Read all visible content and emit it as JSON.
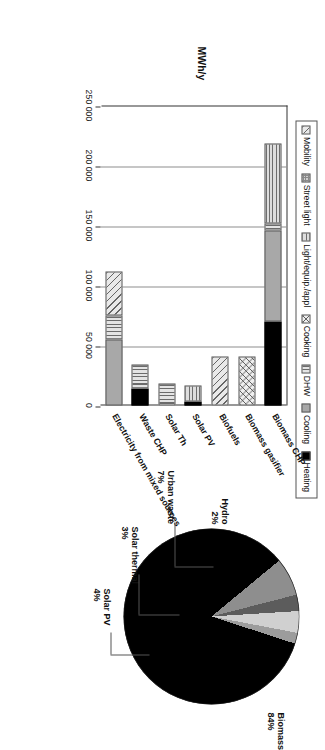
{
  "figure": {
    "orientation_deg": 90,
    "axis_title": "MWh/y"
  },
  "legend": {
    "items": [
      {
        "label": "Mobility",
        "pattern": "diagonal-hatch"
      },
      {
        "label": "Street light",
        "pattern": "checker"
      },
      {
        "label": "Light/equip./appl",
        "pattern": "horizontal-lines"
      },
      {
        "label": "Cooking",
        "pattern": "cross-hatch"
      },
      {
        "label": "DHW",
        "pattern": "vertical-lines"
      },
      {
        "label": "Cooling",
        "pattern": "solid-gray"
      },
      {
        "label": "Heating",
        "pattern": "solid-black"
      }
    ]
  },
  "chart_data": [
    {
      "type": "bar",
      "id": "energy-supply-by-enduse",
      "orientation": "horizontal",
      "stacked": true,
      "title": "",
      "xlabel": "",
      "ylabel": "MWh/y",
      "ylim": [
        0,
        250000
      ],
      "ticks": [
        "250 000",
        "200 000",
        "150 000",
        "100 000",
        "50 000",
        "0"
      ],
      "tick_values": [
        250000,
        200000,
        150000,
        100000,
        50000,
        0
      ],
      "grid": true,
      "legend_position": "top",
      "categories": [
        "Biomass CHP",
        "Biomass gasifier",
        "Biofuels",
        "Solar PV",
        "Solar Th",
        "Waste CHP",
        "Electricity from mixed sources"
      ],
      "series": [
        {
          "name": "Mobility",
          "values": [
            0,
            0,
            41000,
            0,
            0,
            0,
            37000
          ]
        },
        {
          "name": "Street light",
          "values": [
            0,
            0,
            0,
            0,
            0,
            0,
            0
          ]
        },
        {
          "name": "Light/equip./appl",
          "values": [
            66000,
            0,
            0,
            14000,
            0,
            0,
            0
          ]
        },
        {
          "name": "Cooking",
          "values": [
            0,
            41000,
            0,
            0,
            0,
            0,
            0
          ]
        },
        {
          "name": "DHW",
          "values": [
            6000,
            0,
            0,
            0,
            18000,
            20000,
            20000
          ]
        },
        {
          "name": "Cooling",
          "values": [
            76000,
            0,
            0,
            0,
            0,
            0,
            55000
          ]
        },
        {
          "name": "Heating",
          "values": [
            70000,
            0,
            0,
            3000,
            0,
            14000,
            0
          ]
        }
      ],
      "totals": [
        218000,
        41000,
        41000,
        17000,
        18000,
        34000,
        112000
      ]
    },
    {
      "type": "pie",
      "id": "renewable-source-share",
      "title": "",
      "labels": [
        "Biomass",
        "Urban waste",
        "Solar thermal",
        "Solar PV",
        "Hydro"
      ],
      "values": [
        84,
        7,
        3,
        4,
        2
      ],
      "value_labels": [
        "84%",
        "7%",
        "3%",
        "4%",
        "2%"
      ],
      "colors": [
        "#000000",
        "#8e8e8e",
        "#5c5c5c",
        "#d0d0d0",
        "#9c9c9c"
      ],
      "unit": "%"
    }
  ],
  "pie_labels": [
    {
      "name": "Biomass",
      "pct": "84%"
    },
    {
      "name": "Hydro",
      "pct": "2%"
    },
    {
      "name": "Urban waste",
      "pct": "7%"
    },
    {
      "name": "Solar thermal",
      "pct": "3%"
    },
    {
      "name": "Solar PV",
      "pct": "4%"
    }
  ]
}
